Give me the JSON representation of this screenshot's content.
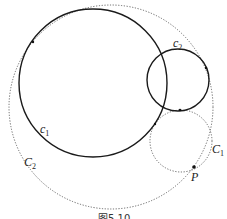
{
  "figure": {
    "caption": "图5.10",
    "circles": [
      {
        "id": "c1",
        "label": "c",
        "sub": "1",
        "style": "solid",
        "cx": 93,
        "cy": 83,
        "r": 74,
        "label_x": 40,
        "label_y": 133
      },
      {
        "id": "c2",
        "label": "c",
        "sub": "2",
        "style": "solid",
        "cx": 178,
        "cy": 80,
        "r": 31,
        "label_x": 173,
        "label_y": 47
      },
      {
        "id": "C1",
        "label": "C",
        "sub": "1",
        "style": "dotted",
        "cx": 181,
        "cy": 141,
        "r": 31,
        "label_x": 213,
        "label_y": 152
      },
      {
        "id": "C2",
        "label": "C",
        "sub": "2",
        "style": "dotted",
        "cx": 111,
        "cy": 107,
        "r": 102,
        "label_x": 24,
        "label_y": 166
      }
    ],
    "point": {
      "label": "P",
      "x": 194,
      "y": 167,
      "label_x": 192,
      "label_y": 180
    },
    "colors": {
      "solid": "#1a1a1a",
      "dotted": "#666666"
    }
  }
}
